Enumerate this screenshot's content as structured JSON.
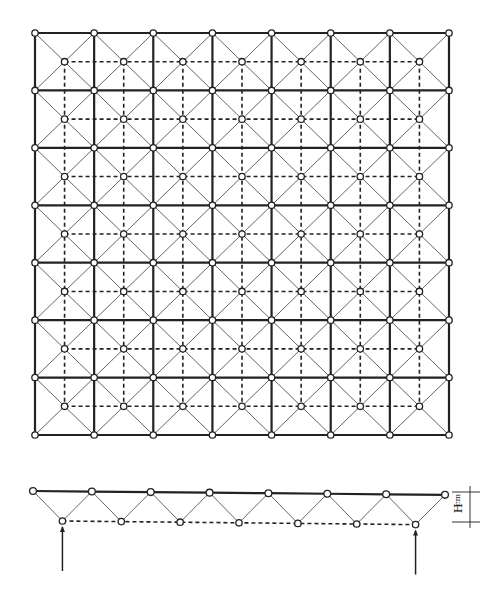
{
  "figure": {
    "plan_view": {
      "top_grid_divisions": 7,
      "top_nodes_per_side": 8,
      "bottom_nodes_per_side": 7,
      "origin": [
        35,
        33
      ],
      "size": [
        414,
        402
      ]
    },
    "elevation_view": {
      "top_chord_nodes": 8,
      "bottom_chord_nodes": 7,
      "top_y": 491,
      "bottom_y": 521,
      "supports": "arrows under first and last bottom nodes"
    },
    "dimension_label": {
      "main": "H",
      "subscript": "cm"
    },
    "colors": {
      "line": "#222222",
      "diagonal": "#666666",
      "background": "#ffffff"
    }
  }
}
